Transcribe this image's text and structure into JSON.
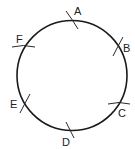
{
  "diagram": {
    "type": "circle-with-marked-points",
    "circle": {
      "cx": 72,
      "cy": 75.5,
      "r": 55,
      "stroke": "#1a1a1a",
      "stroke_width": 1.6
    },
    "points": [
      {
        "label": "A",
        "tick": {
          "x1": 67,
          "y1": 11,
          "x2": 78,
          "y2": 28
        },
        "label_pos": {
          "x": 74,
          "y": 15
        }
      },
      {
        "label": "B",
        "tick": {
          "x1": 123,
          "y1": 37,
          "x2": 113,
          "y2": 56
        },
        "label_pos": {
          "x": 123,
          "y": 52
        }
      },
      {
        "label": "C",
        "tick": {
          "x1": 108,
          "y1": 103,
          "x2": 130,
          "y2": 104
        },
        "label_pos": {
          "x": 118,
          "y": 117
        }
      },
      {
        "label": "D",
        "tick": {
          "x1": 67,
          "y1": 122,
          "x2": 74,
          "y2": 138
        },
        "label_pos": {
          "x": 62,
          "y": 145
        }
      },
      {
        "label": "E",
        "tick": {
          "x1": 20,
          "y1": 112,
          "x2": 30,
          "y2": 94
        },
        "label_pos": {
          "x": 10,
          "y": 108
        }
      },
      {
        "label": "F",
        "tick": {
          "x1": 12,
          "y1": 46,
          "x2": 35,
          "y2": 46
        },
        "label_pos": {
          "x": 16,
          "y": 43
        }
      }
    ]
  }
}
